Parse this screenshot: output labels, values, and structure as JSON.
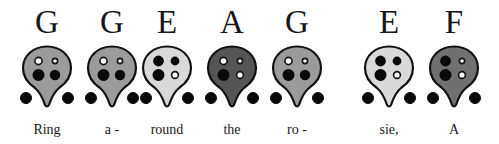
{
  "chart_data": {
    "type": "table",
    "notes": [
      {
        "note": "G",
        "lyric": "Ring",
        "body_color": "#9b9b9b",
        "holes": {
          "top_left": "open",
          "top_right": "open",
          "bottom_left": "closed",
          "bottom_right": "closed",
          "thumb_left": "closed",
          "thumb_right": "closed"
        }
      },
      {
        "note": "G",
        "lyric": "a -",
        "body_color": "#9b9b9b",
        "holes": {
          "top_left": "open",
          "top_right": "open",
          "bottom_left": "closed",
          "bottom_right": "closed",
          "thumb_left": "closed",
          "thumb_right": "closed"
        }
      },
      {
        "note": "E",
        "lyric": "round",
        "body_color": "#d9d9d9",
        "holes": {
          "top_left": "closed",
          "top_right": "closed",
          "bottom_left": "closed",
          "bottom_right": "open",
          "thumb_left": "closed",
          "thumb_right": "closed"
        }
      },
      {
        "note": "A",
        "lyric": "the",
        "body_color": "#555555",
        "holes": {
          "top_left": "open",
          "top_right": "open",
          "bottom_left": "closed",
          "bottom_right": "open",
          "thumb_left": "closed",
          "thumb_right": "closed"
        }
      },
      {
        "note": "G",
        "lyric": "ro -",
        "body_color": "#9b9b9b",
        "holes": {
          "top_left": "open",
          "top_right": "open",
          "bottom_left": "closed",
          "bottom_right": "closed",
          "thumb_left": "closed",
          "thumb_right": "closed"
        }
      },
      {
        "note": "E",
        "lyric": "sie,",
        "body_color": "#d9d9d9",
        "holes": {
          "top_left": "closed",
          "top_right": "closed",
          "bottom_left": "closed",
          "bottom_right": "open",
          "thumb_left": "closed",
          "thumb_right": "closed"
        }
      },
      {
        "note": "F",
        "lyric": "A",
        "body_color": "#707070",
        "holes": {
          "top_left": "closed",
          "top_right": "open",
          "bottom_left": "closed",
          "bottom_right": "open",
          "thumb_left": "closed",
          "thumb_right": "closed"
        }
      }
    ]
  },
  "columns": [
    {
      "note": "G",
      "lyric": "Ring"
    },
    {
      "note": "G",
      "lyric": "a -"
    },
    {
      "note": "E",
      "lyric": "round"
    },
    {
      "note": "A",
      "lyric": "the"
    },
    {
      "note": "G",
      "lyric": "ro -"
    },
    {
      "note": "E",
      "lyric": "sie,"
    },
    {
      "note": "F",
      "lyric": "A"
    }
  ],
  "layout": {
    "centers_x": [
      47,
      112,
      167,
      232,
      297,
      389,
      454
    ]
  },
  "colors": {
    "outline": "#111111",
    "hole_closed": "#0a0a0a",
    "hole_open_fill": "#ffffff"
  }
}
